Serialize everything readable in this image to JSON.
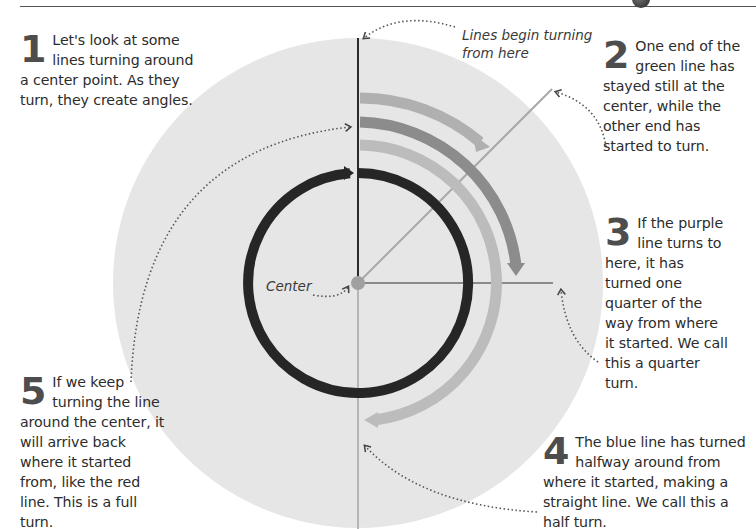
{
  "diagram": {
    "type": "turning-lines-angles",
    "colors": {
      "background_disc": "#e6e6e6",
      "start_line": "#2a2a2a",
      "green_line": "#a8a8a8",
      "purple_line": "#8a8a8a",
      "blue_line": "#b5b5b5",
      "red_circle": "#262626",
      "arc_outer": "#b0b0b0",
      "arc_middle": "#8c8c8c",
      "arc_inner": "#bcbcbc",
      "center_dot": "#a0a0a0"
    },
    "labels": {
      "start_callout_line1": "Lines begin turning",
      "start_callout_line2": "from here",
      "center": "Center"
    }
  },
  "steps": [
    {
      "number": "1",
      "text_first": "Let's look at some lines turning around a",
      "text_rest": "center point. As they turn, they create angles."
    },
    {
      "number": "2",
      "text_first": "One end of the green line has",
      "text_rest": "stayed still at the center, while the other end has started to turn."
    },
    {
      "number": "3",
      "text_first": "If the purple line turns to",
      "text_rest": "here, it has turned one quarter of the way from where it started. We call this a quarter turn."
    },
    {
      "number": "4",
      "text_first": "The blue line has turned halfway around",
      "text_rest": "from where it started, making a straight line. We call this a half turn."
    },
    {
      "number": "5",
      "text_first": "If we keep turning the",
      "text_rest": "line around the center, it will arrive back where it started from, like the red line. This is a full turn."
    }
  ]
}
